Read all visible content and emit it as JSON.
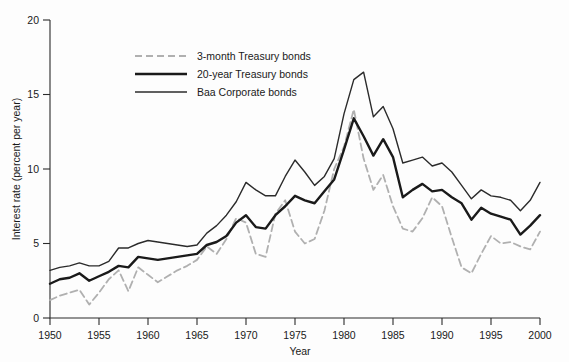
{
  "chart_data": {
    "type": "line",
    "title": "",
    "xlabel": "Year",
    "ylabel": "Interest rate (percent per year)",
    "xlim": [
      1950,
      2000
    ],
    "ylim": [
      0,
      20
    ],
    "xticks": [
      1950,
      1955,
      1960,
      1965,
      1970,
      1975,
      1980,
      1985,
      1990,
      1995,
      2000
    ],
    "yticks": [
      0,
      5,
      10,
      15,
      20
    ],
    "grid": false,
    "legend_position": "upper-left-inside",
    "x": [
      1950,
      1951,
      1952,
      1953,
      1954,
      1955,
      1956,
      1957,
      1958,
      1959,
      1960,
      1961,
      1962,
      1963,
      1964,
      1965,
      1966,
      1967,
      1968,
      1969,
      1970,
      1971,
      1972,
      1973,
      1974,
      1975,
      1976,
      1977,
      1978,
      1979,
      1980,
      1981,
      1982,
      1983,
      1984,
      1985,
      1986,
      1987,
      1988,
      1989,
      1990,
      1991,
      1992,
      1993,
      1994,
      1995,
      1996,
      1997,
      1998,
      1999,
      2000
    ],
    "series": [
      {
        "name": "3-month Treasury bonds",
        "color": "#b0b0b0",
        "style": "dashed",
        "width": 1.8,
        "values": [
          1.2,
          1.5,
          1.7,
          1.9,
          0.9,
          1.7,
          2.6,
          3.2,
          1.8,
          3.4,
          2.9,
          2.4,
          2.8,
          3.2,
          3.5,
          3.9,
          4.8,
          4.3,
          5.3,
          6.7,
          6.4,
          4.3,
          4.1,
          7.0,
          7.9,
          5.8,
          5.0,
          5.3,
          7.2,
          10.0,
          11.5,
          14.0,
          10.7,
          8.6,
          9.6,
          7.5,
          6.0,
          5.8,
          6.7,
          8.1,
          7.5,
          5.4,
          3.4,
          3.0,
          4.3,
          5.5,
          5.0,
          5.1,
          4.8,
          4.6,
          5.8
        ]
      },
      {
        "name": "20-year Treasury bonds",
        "color": "#1a1a1a",
        "style": "solid",
        "width": 2.4,
        "values": [
          2.3,
          2.6,
          2.7,
          3.0,
          2.5,
          2.8,
          3.1,
          3.5,
          3.4,
          4.1,
          4.0,
          3.9,
          4.0,
          4.1,
          4.2,
          4.3,
          4.9,
          5.1,
          5.5,
          6.4,
          6.9,
          6.1,
          6.0,
          6.9,
          7.5,
          8.2,
          7.9,
          7.7,
          8.5,
          9.3,
          11.3,
          13.4,
          12.2,
          10.9,
          12.0,
          10.8,
          8.1,
          8.6,
          9.0,
          8.5,
          8.6,
          8.1,
          7.7,
          6.6,
          7.4,
          7.0,
          6.8,
          6.6,
          5.6,
          6.2,
          6.9
        ]
      },
      {
        "name": "Baa Corporate bonds",
        "color": "#2b2b2b",
        "style": "solid",
        "width": 1.4,
        "values": [
          3.2,
          3.4,
          3.5,
          3.7,
          3.5,
          3.5,
          3.8,
          4.7,
          4.7,
          5.0,
          5.2,
          5.1,
          5.0,
          4.9,
          4.8,
          4.9,
          5.7,
          6.2,
          6.9,
          7.8,
          9.1,
          8.6,
          8.2,
          8.2,
          9.5,
          10.6,
          9.8,
          8.9,
          9.5,
          10.7,
          13.7,
          16.0,
          16.5,
          13.5,
          14.2,
          12.7,
          10.4,
          10.6,
          10.8,
          10.2,
          10.4,
          9.8,
          8.9,
          8.0,
          8.6,
          8.2,
          8.1,
          7.9,
          7.2,
          7.9,
          9.1
        ]
      }
    ]
  },
  "legend": {
    "entries": [
      {
        "label": "3-month Treasury bonds"
      },
      {
        "label": "20-year Treasury bonds"
      },
      {
        "label": "Baa Corporate bonds"
      }
    ]
  },
  "axes": {
    "y_title": "Interest rate (percent per year)",
    "x_title": "Year",
    "y_tick_labels": [
      "0",
      "5",
      "10",
      "15",
      "20"
    ],
    "x_tick_labels": [
      "1950",
      "1955",
      "1960",
      "1965",
      "1970",
      "1975",
      "1980",
      "1985",
      "1990",
      "1995",
      "2000"
    ]
  }
}
